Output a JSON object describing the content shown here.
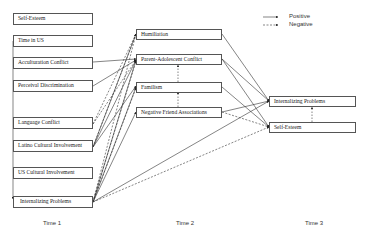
{
  "legend": {
    "positive": "Positive",
    "negative": "Negative"
  },
  "time_labels": {
    "t1": "Time 1",
    "t2": "Time 2",
    "t3": "Time 3"
  },
  "time1": {
    "self_esteem": "Self-Esteem",
    "time_in_us": "Time in US",
    "acculturation_conflict": "Acculturation Conflict",
    "perceived_discrimination": "Perceival Discrimination",
    "language_conflict": "Language Conflict",
    "latino_cultural_involvement": "Latino Cultural Involvement",
    "us_cultural_involvement": "US Cultural Involvement",
    "internalizing_problems": "Internalizing Problems"
  },
  "time2": {
    "humiliation": "Humiliation",
    "parent_adolescent_conflict": "Parent-Adolescent Conflict",
    "familism": "Familism",
    "negative_friend_associations": "Negative Friend Associations"
  },
  "time3": {
    "internalizing_problems": "Internalizing Problems",
    "self_esteem": "Self-Esteem"
  },
  "colors": {
    "line": "#333333",
    "box_border": "#555555"
  }
}
